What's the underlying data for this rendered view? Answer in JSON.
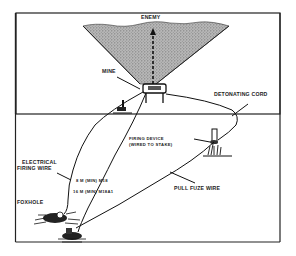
{
  "figure": {
    "labels": {
      "enemy": "ENEMY",
      "mine": "MINE",
      "detonating_cord": "DETONATING CORD",
      "firing_device_line1": "FIRING DEVICE",
      "firing_device_line2": "(WIRED TO STAKE)",
      "electrical_line1": "ELECTRICAL",
      "electrical_line2": "FIRING WIRE",
      "distance_m18": "8 M (MIN) M18",
      "distance_m18a1": "16 M (MIN) M18A1",
      "foxhole": "FOXHOLE",
      "pull_fuze": "PULL FUZE WIRE"
    }
  }
}
